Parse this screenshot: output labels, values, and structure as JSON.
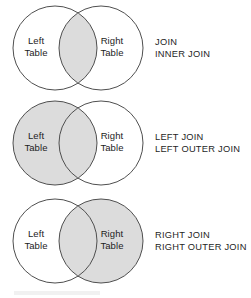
{
  "figure": {
    "name": "sql-join-venn-diagram",
    "background_color": "#ffffff",
    "shade_color": "#dcdcdc",
    "stroke_color": "#4f4f4f",
    "text_color": "#1e1e1e"
  },
  "circle_labels": {
    "left_line1": "Left",
    "left_line2": "Table",
    "right_line1": "Right",
    "right_line2": "Table"
  },
  "rows": [
    {
      "id": "inner-join",
      "shaded_region": "intersection",
      "caption_line1": "JOIN",
      "caption_line2": "INNER JOIN"
    },
    {
      "id": "left-join",
      "shaded_region": "left-circle",
      "caption_line1": "LEFT JOIN",
      "caption_line2": "LEFT OUTER JOIN"
    },
    {
      "id": "right-join",
      "shaded_region": "right-circle",
      "caption_line1": "RIGHT JOIN",
      "caption_line2": "RIGHT OUTER JOIN"
    }
  ]
}
